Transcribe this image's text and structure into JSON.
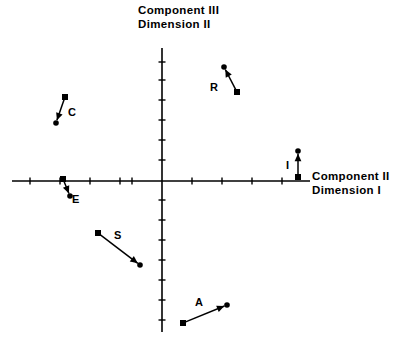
{
  "figure": {
    "background_color": "#ffffff",
    "ink_color": "#000000",
    "width": 411,
    "height": 338
  },
  "axes": {
    "vertical_axis_title_line1": "Component III",
    "vertical_axis_title_line2": "Dimension II",
    "horizontal_axis_title_line1": "Component II",
    "horizontal_axis_title_line2": "Dimension I",
    "origin": {
      "x": 162,
      "y": 181
    },
    "x_axis": {
      "start_x": 12,
      "end_x": 310,
      "y": 181
    },
    "y_axis": {
      "x": 162,
      "start_y": 48,
      "end_y": 332
    },
    "x_tick_positions": [
      30,
      60,
      90,
      120,
      132,
      192,
      222,
      252,
      282
    ],
    "y_tick_positions": [
      62,
      80,
      100,
      120,
      140,
      160,
      200,
      220,
      240,
      260,
      280,
      300,
      320
    ],
    "tick_length": 7,
    "grid": false
  },
  "chart_data": {
    "type": "scatter",
    "xlabel": "Component II  Dimension I",
    "ylabel": "Component III  Dimension II",
    "grid": false,
    "legend": "none",
    "note": "Each item is drawn as a vector: a square tail marker joined by an arrow to a round head marker.",
    "series": [
      {
        "name": "R",
        "label": "R",
        "label_pos": {
          "x": 210,
          "y": 81
        },
        "tail_marker": "square",
        "head_marker": "circle-arrow",
        "tail": {
          "x": 237,
          "y": 92
        },
        "head": {
          "x": 224,
          "y": 67
        }
      },
      {
        "name": "C",
        "label": "C",
        "label_pos": {
          "x": 68,
          "y": 106
        },
        "tail_marker": "square",
        "head_marker": "circle-arrow",
        "tail": {
          "x": 65,
          "y": 97
        },
        "head": {
          "x": 56,
          "y": 123
        }
      },
      {
        "name": "I",
        "label": "I",
        "label_pos": {
          "x": 286,
          "y": 159
        },
        "tail_marker": "square",
        "head_marker": "circle-arrow",
        "tail": {
          "x": 298,
          "y": 177
        },
        "head": {
          "x": 298,
          "y": 151
        }
      },
      {
        "name": "E",
        "label": "E",
        "label_pos": {
          "x": 72,
          "y": 193
        },
        "tail_marker": "square",
        "head_marker": "circle-arrow",
        "tail": {
          "x": 63,
          "y": 179
        },
        "head": {
          "x": 70,
          "y": 196
        }
      },
      {
        "name": "S",
        "label": "S",
        "label_pos": {
          "x": 114,
          "y": 229
        },
        "tail_marker": "square",
        "head_marker": "circle-arrow",
        "tail": {
          "x": 98,
          "y": 233
        },
        "head": {
          "x": 140,
          "y": 265
        }
      },
      {
        "name": "A",
        "label": "A",
        "label_pos": {
          "x": 195,
          "y": 296
        },
        "tail_marker": "square",
        "head_marker": "circle-arrow",
        "tail": {
          "x": 183,
          "y": 323
        },
        "head": {
          "x": 227,
          "y": 305
        }
      }
    ]
  }
}
